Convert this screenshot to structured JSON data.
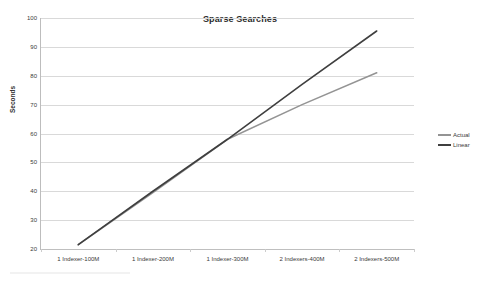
{
  "chart": {
    "title": "Sparse Searches",
    "y_axis_title": "Seconds"
  },
  "legend": {
    "position": "right",
    "entries": [
      {
        "label": "Actual",
        "color": "#949494"
      },
      {
        "label": "Linear",
        "color": "#3f3f3f"
      }
    ]
  },
  "chart_data": {
    "type": "line",
    "title": "Sparse Searches",
    "xlabel": "",
    "ylabel": "Seconds",
    "ylim": [
      20,
      100
    ],
    "yticks": [
      20,
      30,
      40,
      50,
      60,
      70,
      80,
      90,
      100
    ],
    "grid": true,
    "legend_position": "right",
    "categories": [
      "1 Indexer-100M",
      "1 Indexer-200M",
      "1 Indexer-300M",
      "2 Indexers-400M",
      "2 Indexers-500M"
    ],
    "series": [
      {
        "name": "Actual",
        "color": "#949494",
        "values": [
          21.5,
          39.5,
          58,
          70,
          81
        ]
      },
      {
        "name": "Linear",
        "color": "#3f3f3f",
        "values": [
          21.5,
          40,
          58,
          77,
          95.5
        ]
      }
    ]
  }
}
